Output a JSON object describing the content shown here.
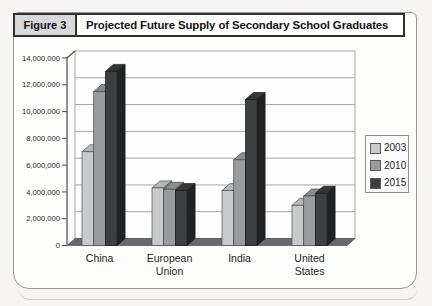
{
  "figure": {
    "label": "Figure 3",
    "title": "Projected Future Supply of Secondary School Graduates"
  },
  "chart_data": {
    "type": "bar",
    "style": "3d-column",
    "title": "Projected Future Supply of Secondary School Graduates",
    "categories": [
      "China",
      "European Union",
      "India",
      "United States"
    ],
    "series": [
      {
        "name": "2003",
        "values": [
          7000000,
          4300000,
          4100000,
          3000000
        ],
        "colors": {
          "front": "#c9cacc",
          "top": "#b5b6b8",
          "side": "#98999b",
          "stroke": "#4f4f51"
        }
      },
      {
        "name": "2010",
        "values": [
          11500000,
          4200000,
          6400000,
          3700000
        ],
        "colors": {
          "front": "#9a9b9d",
          "top": "#8a8b8d",
          "side": "#707173",
          "stroke": "#48484a"
        }
      },
      {
        "name": "2015",
        "values": [
          13000000,
          4100000,
          10900000,
          3900000
        ],
        "colors": {
          "front": "#3e3f41",
          "top": "#353638",
          "side": "#202123",
          "stroke": "#1a1a1c"
        }
      }
    ],
    "ylim": [
      0,
      14000000
    ],
    "ytick_step": 2000000,
    "ytick_labels": [
      "0",
      "2,000,000",
      "4,000,000",
      "6,000,000",
      "8,000,000",
      "10,000,000",
      "12,000,000",
      "14,000,000"
    ],
    "xlabel": "",
    "ylabel": "",
    "grid": true,
    "legend_position": "right",
    "wall_color": "#fefefe",
    "floor_color": "#68696b",
    "gridline_color": "#a3a3a3",
    "axis_color": "#4c4c4e"
  }
}
